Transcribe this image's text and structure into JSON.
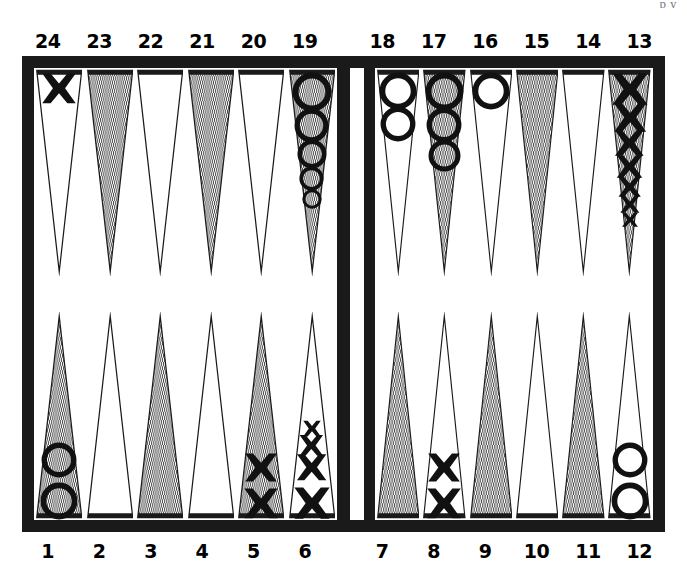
{
  "figure": {
    "name": "backgammon-board-diagram",
    "cut_off_caption": "p  y",
    "colors": {
      "frame": "#1a1a1a",
      "board": "#ffffff",
      "point_shaded": "#b9b9b9",
      "point_plain": "#ffffff",
      "outline": "#1a1a1a",
      "label": "#000000"
    }
  },
  "labels": {
    "top_left": [
      "24",
      "23",
      "22",
      "21",
      "20",
      "19"
    ],
    "top_right": [
      "18",
      "17",
      "16",
      "15",
      "14",
      "13"
    ],
    "bottom_left": [
      "1",
      "2",
      "3",
      "4",
      "5",
      "6"
    ],
    "bottom_right": [
      "7",
      "8",
      "9",
      "10",
      "11",
      "12"
    ]
  },
  "chart_data": {
    "type": "diagram",
    "checker_symbols": {
      "X": "cross-checker",
      "O": "ring-checker"
    },
    "point_shading": {
      "shaded": "dotted-grey triangle",
      "plain": "white triangle"
    },
    "points": [
      {
        "number": "24",
        "shaded": false,
        "checker": "X",
        "count": 1
      },
      {
        "number": "23",
        "shaded": true,
        "checker": "",
        "count": 0
      },
      {
        "number": "22",
        "shaded": false,
        "checker": "",
        "count": 0
      },
      {
        "number": "21",
        "shaded": true,
        "checker": "",
        "count": 0
      },
      {
        "number": "20",
        "shaded": false,
        "checker": "",
        "count": 0
      },
      {
        "number": "19",
        "shaded": true,
        "checker": "O",
        "count": 5
      },
      {
        "number": "18",
        "shaded": false,
        "checker": "O",
        "count": 2
      },
      {
        "number": "17",
        "shaded": true,
        "checker": "O",
        "count": 3
      },
      {
        "number": "16",
        "shaded": false,
        "checker": "O",
        "count": 1
      },
      {
        "number": "15",
        "shaded": true,
        "checker": "",
        "count": 0
      },
      {
        "number": "14",
        "shaded": false,
        "checker": "",
        "count": 0
      },
      {
        "number": "13",
        "shaded": true,
        "checker": "X",
        "count": 7
      },
      {
        "number": "12",
        "shaded": false,
        "checker": "O",
        "count": 2
      },
      {
        "number": "11",
        "shaded": true,
        "checker": "",
        "count": 0
      },
      {
        "number": "10",
        "shaded": false,
        "checker": "",
        "count": 0
      },
      {
        "number": "9",
        "shaded": true,
        "checker": "",
        "count": 0
      },
      {
        "number": "8",
        "shaded": false,
        "checker": "X",
        "count": 2
      },
      {
        "number": "7",
        "shaded": true,
        "checker": "",
        "count": 0
      },
      {
        "number": "6",
        "shaded": false,
        "checker": "X",
        "count": 4
      },
      {
        "number": "5",
        "shaded": true,
        "checker": "X",
        "count": 2
      },
      {
        "number": "4",
        "shaded": false,
        "checker": "",
        "count": 0
      },
      {
        "number": "3",
        "shaded": true,
        "checker": "",
        "count": 0
      },
      {
        "number": "2",
        "shaded": false,
        "checker": "",
        "count": 0
      },
      {
        "number": "1",
        "shaded": true,
        "checker": "O",
        "count": 2
      }
    ],
    "totals": {
      "X": 16,
      "O": 15
    },
    "bar": {
      "X": 0,
      "O": 0
    }
  }
}
